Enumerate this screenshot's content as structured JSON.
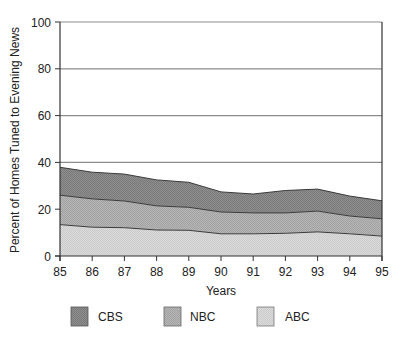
{
  "chart_data": {
    "type": "area",
    "stacked": true,
    "title": "",
    "xlabel": "Years",
    "ylabel": "Percent of Homes Tuned to Evening News",
    "x": [
      "85",
      "86",
      "87",
      "88",
      "89",
      "90",
      "91",
      "92",
      "93",
      "94",
      "95"
    ],
    "ylim": [
      0,
      100
    ],
    "yticks": [
      "0",
      "20",
      "40",
      "60",
      "80",
      "100"
    ],
    "grid": true,
    "legend_position": "bottom",
    "series": [
      {
        "name": "ABC",
        "values": [
          13.4,
          12.3,
          12.1,
          11.1,
          11.0,
          9.5,
          9.5,
          9.7,
          10.3,
          9.5,
          8.5
        ],
        "color": "#d6d6d6"
      },
      {
        "name": "NBC",
        "values": [
          12.6,
          12.1,
          11.4,
          10.3,
          9.8,
          9.3,
          8.9,
          8.7,
          8.9,
          7.6,
          7.4
        ],
        "color": "#b0b0b0"
      },
      {
        "name": "CBS",
        "values": [
          11.9,
          11.4,
          11.5,
          11.1,
          10.7,
          8.6,
          8.1,
          9.6,
          9.4,
          8.5,
          7.7
        ],
        "color": "#8a8a8a"
      }
    ],
    "cumulative_tops": {
      "ABC": [
        13.4,
        12.3,
        12.1,
        11.1,
        11.0,
        9.5,
        9.5,
        9.7,
        10.3,
        9.5,
        8.5
      ],
      "NBC": [
        26.0,
        24.4,
        23.5,
        21.4,
        20.8,
        18.8,
        18.4,
        18.4,
        19.2,
        17.1,
        15.9
      ],
      "CBS": [
        37.9,
        35.8,
        35.0,
        32.5,
        31.5,
        27.4,
        26.5,
        28.0,
        28.6,
        25.6,
        23.6
      ]
    }
  },
  "legend": {
    "items": [
      {
        "label": "CBS",
        "color": "#8a8a8a"
      },
      {
        "label": "NBC",
        "color": "#b0b0b0"
      },
      {
        "label": "ABC",
        "color": "#d6d6d6"
      }
    ]
  },
  "colors": {
    "grid": "#8c8c8c",
    "axis": "#333333",
    "outline": "#3a3a3a"
  }
}
